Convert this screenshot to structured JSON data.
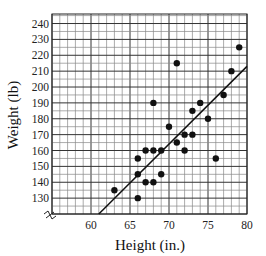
{
  "chart_data": {
    "type": "scatter",
    "title": "",
    "xlabel": "Height (in.)",
    "ylabel": "Weight (lb)",
    "xlim": [
      55,
      80
    ],
    "ylim": [
      120,
      246
    ],
    "x_ticks": [
      60,
      65,
      70,
      75,
      80
    ],
    "y_ticks": [
      130,
      140,
      150,
      160,
      170,
      180,
      190,
      200,
      210,
      220,
      230,
      240
    ],
    "grid": true,
    "grid_minor": {
      "x_step": 1,
      "y_step": 5
    },
    "axis_break": true,
    "legend": null,
    "series": [
      {
        "name": "data",
        "points": [
          [
            63,
            135
          ],
          [
            66,
            130
          ],
          [
            66,
            145
          ],
          [
            66,
            155
          ],
          [
            67,
            140
          ],
          [
            67,
            160
          ],
          [
            68,
            140
          ],
          [
            68,
            160
          ],
          [
            68,
            190
          ],
          [
            69,
            145
          ],
          [
            69,
            160
          ],
          [
            70,
            175
          ],
          [
            71,
            165
          ],
          [
            71,
            215
          ],
          [
            72,
            160
          ],
          [
            72,
            170
          ],
          [
            73,
            170
          ],
          [
            73,
            185
          ],
          [
            74,
            190
          ],
          [
            75,
            180
          ],
          [
            76,
            155
          ],
          [
            77,
            195
          ],
          [
            78,
            210
          ],
          [
            79,
            225
          ]
        ]
      }
    ],
    "trend_line": {
      "x1": 61,
      "y1": 120,
      "x2": 80,
      "y2": 213
    }
  },
  "labels": {
    "x_axis": "Height (in.)",
    "y_axis": "Weight (lb)"
  }
}
